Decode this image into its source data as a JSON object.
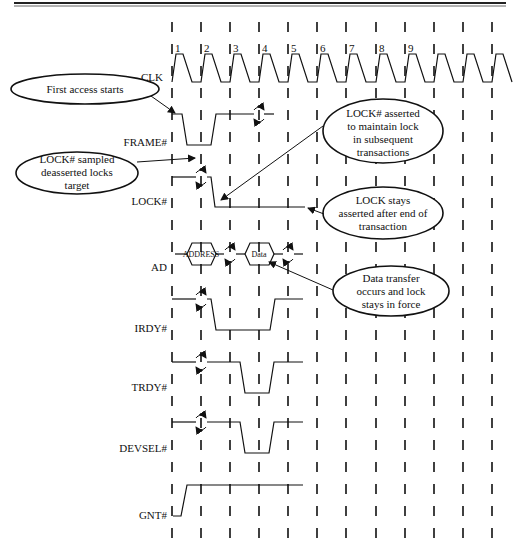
{
  "diagram": {
    "type": "timing-diagram",
    "clock_numbers": [
      "1",
      "2",
      "3",
      "4",
      "5",
      "6",
      "7",
      "8",
      "9"
    ],
    "signals": [
      {
        "name": "CLK"
      },
      {
        "name": "FRAME#"
      },
      {
        "name": "LOCK#"
      },
      {
        "name": "AD"
      },
      {
        "name": "IRDY#"
      },
      {
        "name": "TRDY#"
      },
      {
        "name": "DEVSEL#"
      },
      {
        "name": "GNT#"
      }
    ],
    "bus_values": {
      "address": "ADDRESS",
      "data": "Data"
    },
    "callouts": [
      {
        "id": "first-access",
        "lines": [
          "First access starts"
        ]
      },
      {
        "id": "lock-sampled",
        "lines": [
          "LOCK# sampled",
          "deasserted locks",
          "target"
        ]
      },
      {
        "id": "lock-asserted",
        "lines": [
          "LOCK# asserted",
          "to maintain lock",
          "in subsequent",
          "transactions"
        ]
      },
      {
        "id": "lock-stays",
        "lines": [
          "LOCK stays",
          "asserted after end of",
          "transaction"
        ]
      },
      {
        "id": "data-transfer",
        "lines": [
          "Data transfer",
          "occurs and lock",
          "stays in force"
        ]
      }
    ]
  }
}
